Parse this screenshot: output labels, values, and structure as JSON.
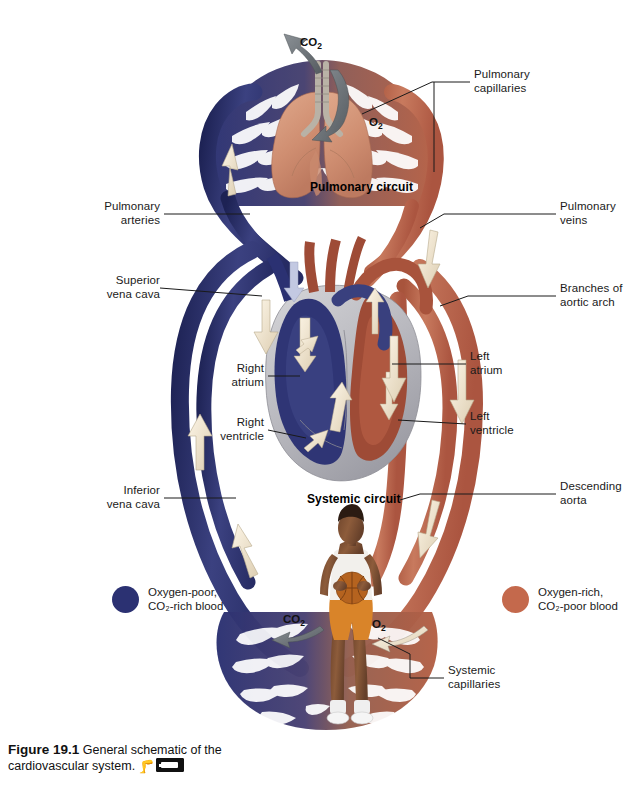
{
  "figure": {
    "number": "Figure 19.1",
    "caption_text": "General schematic of the",
    "caption_text_2": "cardiovascular system.",
    "icon_run": "running-figure-icon",
    "icon_video": "video-media-icon"
  },
  "circuits": [
    {
      "name": "pulmonary-circuit",
      "label": "Pulmonary circuit"
    },
    {
      "name": "systemic-circuit",
      "label": "Systemic circuit"
    }
  ],
  "gas_labels": [
    {
      "name": "co2-pulmonary",
      "label": "CO₂",
      "base": "CO",
      "sub": "2"
    },
    {
      "name": "o2-pulmonary",
      "label": "O₂",
      "base": "O",
      "sub": "2"
    },
    {
      "name": "co2-systemic",
      "label": "CO₂",
      "base": "CO",
      "sub": "2"
    },
    {
      "name": "o2-systemic",
      "label": "O₂",
      "base": "O",
      "sub": "2"
    }
  ],
  "labels": {
    "pulmonary_capillaries": "Pulmonary\ncapillaries",
    "pulmonary_arteries": "Pulmonary\narteries",
    "pulmonary_veins": "Pulmonary\nveins",
    "superior_vena_cava": "Superior\nvena cava",
    "branches_of_aortic_arch": "Branches of\naortic arch",
    "right_atrium": "Right\natrium",
    "left_atrium": "Left\natrium",
    "right_ventricle": "Right\nventricle",
    "left_ventricle": "Left\nventricle",
    "inferior_vena_cava": "Inferior\nvena cava",
    "descending_aorta": "Descending\naorta",
    "systemic_capillaries": "Systemic\ncapillaries"
  },
  "legend": [
    {
      "name": "legend-oxygen-poor",
      "color": "#2b3172",
      "text": "Oxygen-poor,\nCO₂-rich blood"
    },
    {
      "name": "legend-oxygen-rich",
      "color": "#c4694c",
      "text": "Oxygen-rich,\nCO₂-poor blood"
    }
  ],
  "colors": {
    "deoxygenated": "#2b3172",
    "oxygenated": "#c4694c",
    "deoxygenated_mid": "#3d4480",
    "oxygenated_mid": "#b35c42",
    "lung_tissue": "#d89a7e",
    "heart_muscle": "#bfbfc4",
    "arrow_cream": "#f2e6d2",
    "arrow_gray": "#6e7479",
    "leader_line": "#1a1a1a",
    "skin": "#8a5a3c",
    "shirt": "#f2f0ec",
    "shorts": "#d98429",
    "basketball": "#b5631f"
  }
}
